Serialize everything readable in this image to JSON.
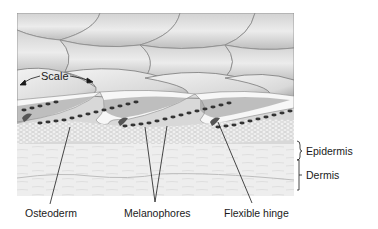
{
  "figure": {
    "colors": {
      "scale_light": "#e8e8e8",
      "scale_mid": "#c9c9c9",
      "scale_dark": "#9a9a9a",
      "dermis": "#ececec",
      "melanophore": "#3a3a3a",
      "line": "#1a1a1a"
    }
  },
  "labels": {
    "scale": "Scale",
    "epidermis": "Epidermis",
    "dermis": "Dermis",
    "osteoderm": "Osteoderm",
    "melanophores": "Melanophores",
    "flexible_hinge": "Flexible hinge"
  }
}
